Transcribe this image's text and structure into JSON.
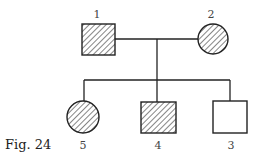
{
  "figure": {
    "caption": "Fig. 24"
  },
  "colors": {
    "stroke": "#222222",
    "hatch": "#444444",
    "background": "#ffffff"
  },
  "individuals": [
    {
      "id": "1",
      "label": "1",
      "sex": "male",
      "affected": true,
      "generation": 1
    },
    {
      "id": "2",
      "label": "2",
      "sex": "female",
      "affected": true,
      "generation": 1
    },
    {
      "id": "5",
      "label": "5",
      "sex": "female",
      "affected": true,
      "generation": 2
    },
    {
      "id": "4",
      "label": "4",
      "sex": "male",
      "affected": true,
      "generation": 2
    },
    {
      "id": "3",
      "label": "3",
      "sex": "male",
      "affected": false,
      "generation": 2
    }
  ]
}
